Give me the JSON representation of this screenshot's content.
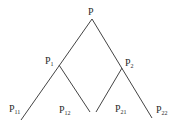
{
  "diagram": {
    "type": "binary-tree",
    "root": {
      "label": "P"
    },
    "level1": [
      {
        "label": "P",
        "sub": "1"
      },
      {
        "label": "P",
        "sub": "2"
      }
    ],
    "level2": [
      {
        "label": "P",
        "sub": "11"
      },
      {
        "label": "P",
        "sub": "12"
      },
      {
        "label": "P",
        "sub": "21"
      },
      {
        "label": "P",
        "sub": "22"
      }
    ],
    "line_color": "#3a3a3a"
  }
}
